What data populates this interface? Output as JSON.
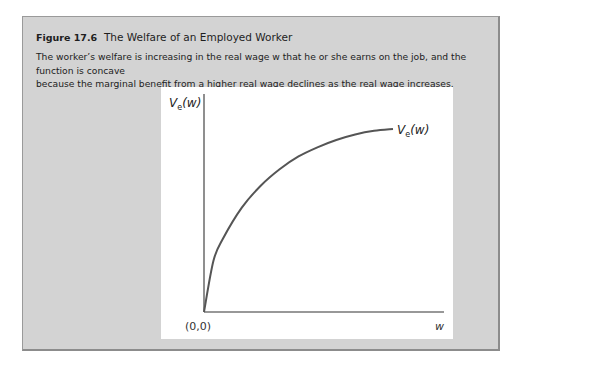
{
  "figure": {
    "number": "Figure 17.6",
    "title": "The Welfare of an Employed Worker",
    "caption_line1": "The worker’s welfare is increasing in the real wage w that he or she earns on the job, and the function is concave",
    "caption_line2": "because the marginal benefit from a higher real wage declines as the real wage increases."
  },
  "chart_data": {
    "type": "line",
    "title": "The Welfare of an Employed Worker",
    "xlabel": "w",
    "ylabel": "Ve(w)",
    "origin_label": "(0,0)",
    "grid": false,
    "legend": null,
    "series": [
      {
        "name": "Ve(w)",
        "shape": "concave increasing",
        "x": [
          0,
          0.05,
          0.1,
          0.2,
          0.3,
          0.4,
          0.5,
          0.6,
          0.7,
          0.8,
          0.9,
          1.0
        ],
        "values": [
          0,
          0.28,
          0.4,
          0.57,
          0.69,
          0.78,
          0.85,
          0.9,
          0.94,
          0.97,
          0.99,
          1.0
        ]
      }
    ],
    "annotations": [
      "Ve(w) label at curve end"
    ],
    "colors": {
      "curve": "#555555",
      "axes": "#333333",
      "panel": "#d3d3d3",
      "plot_bg": "#ffffff"
    }
  }
}
